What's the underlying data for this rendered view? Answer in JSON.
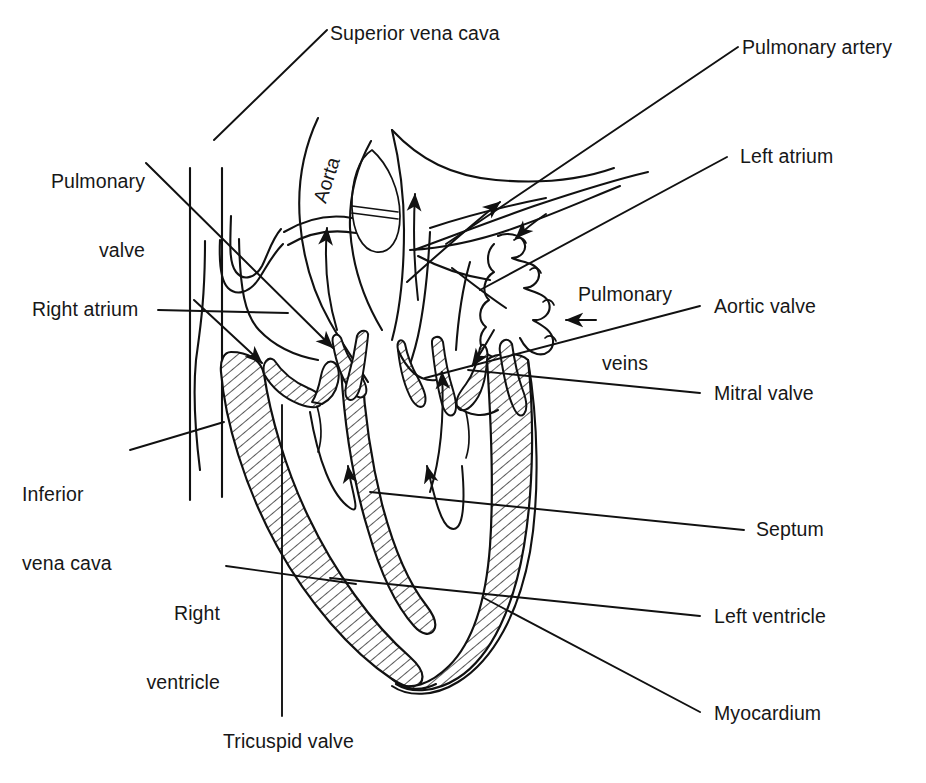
{
  "figure": {
    "type": "anatomical-line-diagram",
    "background_color": "#ffffff",
    "ink_color": "#111111"
  },
  "internal_labels": [
    {
      "id": "aorta",
      "text": "Aorta",
      "rotated": true,
      "rotation_deg": -72
    }
  ],
  "labels": [
    {
      "id": "superior-vena-cava",
      "text": "Superior vena cava",
      "side": "top"
    },
    {
      "id": "pulmonary-artery",
      "text": "Pulmonary artery",
      "side": "right"
    },
    {
      "id": "pulmonary-valve",
      "text": "Pulmonary\nvalve",
      "side": "left"
    },
    {
      "id": "left-atrium",
      "text": "Left atrium",
      "side": "right"
    },
    {
      "id": "pulmonary-veins",
      "text": "Pulmonary\nveins",
      "side": "inner-right"
    },
    {
      "id": "right-atrium",
      "text": "Right atrium",
      "side": "left"
    },
    {
      "id": "aortic-valve",
      "text": "Aortic valve",
      "side": "right"
    },
    {
      "id": "mitral-valve",
      "text": "Mitral valve",
      "side": "right"
    },
    {
      "id": "inferior-vena-cava",
      "text": "Inferior\nvena cava",
      "side": "left"
    },
    {
      "id": "septum",
      "text": "Septum",
      "side": "right"
    },
    {
      "id": "right-ventricle",
      "text": "Right\nventricle",
      "side": "left"
    },
    {
      "id": "left-ventricle",
      "text": "Left ventricle",
      "side": "right"
    },
    {
      "id": "myocardium",
      "text": "Myocardium",
      "side": "right"
    },
    {
      "id": "tricuspid-valve",
      "text": "Tricuspid valve",
      "side": "bottom"
    }
  ],
  "label_text": {
    "superior_vena_cava": "Superior vena cava",
    "pulmonary_artery": "Pulmonary artery",
    "pulmonary_valve_line1": "Pulmonary",
    "pulmonary_valve_line2": "valve",
    "left_atrium": "Left atrium",
    "pulmonary_veins_line1": "Pulmonary",
    "pulmonary_veins_line2": "veins",
    "right_atrium": "Right atrium",
    "aortic_valve": "Aortic valve",
    "mitral_valve": "Mitral valve",
    "inferior_vena_cava_line1": "Inferior",
    "inferior_vena_cava_line2": "vena cava",
    "septum": "Septum",
    "right_ventricle_line1": "Right",
    "right_ventricle_line2": "ventricle",
    "left_ventricle": "Left ventricle",
    "myocardium": "Myocardium",
    "tricuspid_valve": "Tricuspid valve",
    "aorta": "Aorta"
  },
  "flow_arrows": [
    {
      "id": "aorta-flow",
      "direction": "up",
      "region": "aortic arch"
    },
    {
      "id": "pulmonary-artery-flow",
      "direction": "up",
      "region": "pulmonary trunk"
    },
    {
      "id": "pulmonary-branch-flow",
      "direction": "up-right",
      "region": "right pulmonary artery"
    },
    {
      "id": "right-ventricle-flow",
      "direction": "up",
      "region": "right ventricle"
    },
    {
      "id": "left-ventricle-flow",
      "direction": "up",
      "region": "left ventricle"
    },
    {
      "id": "svc-inflow",
      "direction": "down-right",
      "region": "superior vena cava into right atrium"
    },
    {
      "id": "lv-outflow",
      "direction": "up",
      "region": "left ventricular outflow tract"
    }
  ]
}
